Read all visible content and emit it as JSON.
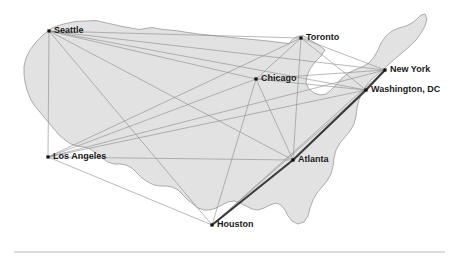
{
  "figure": {
    "title": "",
    "width": 457,
    "height": 265,
    "background_color": "#ffffff",
    "land_fill_color": "#e2e2e2",
    "land_stroke_color": "#9a9a9a",
    "edge_color": "#8a8a8a",
    "highlight_edge_color": "#3a3a3a",
    "label_color": "#1a1a1a",
    "divider_color": "#b9b9b9"
  },
  "chart_data": {
    "type": "scatter",
    "title": "",
    "xlabel": "",
    "ylabel": "",
    "subtitle": "",
    "legend": [],
    "grid": false,
    "nodes": [
      {
        "id": "seattle",
        "label": "Seattle",
        "x": 49,
        "y": 31,
        "label_dx": 5,
        "label_dy": 0,
        "anchor": "start"
      },
      {
        "id": "toronto",
        "label": "Toronto",
        "x": 301,
        "y": 38,
        "label_dx": 5,
        "label_dy": 0,
        "anchor": "start"
      },
      {
        "id": "chicago",
        "label": "Chicago",
        "x": 256,
        "y": 79,
        "label_dx": 5,
        "label_dy": 0,
        "anchor": "start"
      },
      {
        "id": "newyork",
        "label": "New York",
        "x": 385,
        "y": 70,
        "label_dx": 5,
        "label_dy": 0,
        "anchor": "start"
      },
      {
        "id": "washington",
        "label": "Washington, DC",
        "x": 366,
        "y": 90,
        "label_dx": 5,
        "label_dy": 0,
        "anchor": "start"
      },
      {
        "id": "losangeles",
        "label": "Los Angeles",
        "x": 48,
        "y": 157,
        "label_dx": 5,
        "label_dy": 0,
        "anchor": "start"
      },
      {
        "id": "atlanta",
        "label": "Atlanta",
        "x": 293,
        "y": 160,
        "label_dx": 5,
        "label_dy": 0,
        "anchor": "start"
      },
      {
        "id": "houston",
        "label": "Houston",
        "x": 212,
        "y": 225,
        "label_dx": 5,
        "label_dy": 0,
        "anchor": "start"
      }
    ],
    "edges": [
      {
        "from": "seattle",
        "to": "toronto",
        "weight": 1
      },
      {
        "from": "seattle",
        "to": "chicago",
        "weight": 1
      },
      {
        "from": "seattle",
        "to": "newyork",
        "weight": 1
      },
      {
        "from": "seattle",
        "to": "washington",
        "weight": 1
      },
      {
        "from": "seattle",
        "to": "atlanta",
        "weight": 1
      },
      {
        "from": "seattle",
        "to": "houston",
        "weight": 1
      },
      {
        "from": "seattle",
        "to": "losangeles",
        "weight": 1
      },
      {
        "from": "losangeles",
        "to": "chicago",
        "weight": 1
      },
      {
        "from": "losangeles",
        "to": "toronto",
        "weight": 1
      },
      {
        "from": "losangeles",
        "to": "newyork",
        "weight": 1
      },
      {
        "from": "losangeles",
        "to": "washington",
        "weight": 1
      },
      {
        "from": "losangeles",
        "to": "atlanta",
        "weight": 1
      },
      {
        "from": "losangeles",
        "to": "houston",
        "weight": 1
      },
      {
        "from": "chicago",
        "to": "toronto",
        "weight": 1
      },
      {
        "from": "chicago",
        "to": "newyork",
        "weight": 1
      },
      {
        "from": "chicago",
        "to": "washington",
        "weight": 1
      },
      {
        "from": "chicago",
        "to": "atlanta",
        "weight": 1
      },
      {
        "from": "chicago",
        "to": "houston",
        "weight": 1
      },
      {
        "from": "toronto",
        "to": "newyork",
        "weight": 1
      },
      {
        "from": "toronto",
        "to": "washington",
        "weight": 1
      },
      {
        "from": "toronto",
        "to": "atlanta",
        "weight": 1
      },
      {
        "from": "newyork",
        "to": "washington",
        "weight": 1
      },
      {
        "from": "newyork",
        "to": "atlanta",
        "weight": 1
      },
      {
        "from": "newyork",
        "to": "houston",
        "weight": 1
      },
      {
        "from": "washington",
        "to": "atlanta",
        "weight": 1
      },
      {
        "from": "washington",
        "to": "houston",
        "weight": 1
      },
      {
        "from": "atlanta",
        "to": "houston",
        "weight": 1
      }
    ],
    "highlighted_edges": [
      {
        "from": "houston",
        "to": "atlanta",
        "weight": 4
      },
      {
        "from": "atlanta",
        "to": "washington",
        "weight": 4
      },
      {
        "from": "washington",
        "to": "newyork",
        "weight": 4
      }
    ]
  },
  "map": {
    "land_path": "M 63,25 L 72,22 L 96,20 L 118,26 L 140,29 L 150,27 L 160,29 L 168,27 L 176,31 L 196,35 L 228,38 L 262,41 L 286,44 L 296,40 L 300,37 L 306,36 L 316,40 L 324,44 L 330,40 L 336,36 L 342,30 L 350,24 L 358,20 L 366,17 L 374,15 L 382,19 L 386,26 L 390,33 L 396,38 L 404,41 L 412,44 L 418,50 L 420,58 L 414,62 L 404,64 L 394,68 L 386,71 L 378,76 L 372,82 L 366,90 L 362,98 L 356,104 L 350,110 L 346,118 L 344,128 L 346,138 L 348,148 L 346,158 L 340,166 L 334,174 L 330,182 L 326,190 L 320,198 L 314,206 L 308,212 L 300,216 L 292,218 L 286,222 L 280,226 L 274,230 L 266,232 L 258,230 L 250,228 L 242,226 L 234,224 L 226,226 L 218,228 L 210,227 L 204,223 L 198,218 L 192,212 L 186,206 L 180,200 L 174,196 L 166,194 L 158,192 L 150,190 L 144,186 L 138,180 L 132,174 L 126,170 L 118,168 L 110,166 L 104,162 L 98,156 L 92,150 L 86,146 L 78,144 L 70,142 L 62,138 L 56,132 L 50,126 L 44,120 L 38,114 L 32,108 L 28,100 L 26,92 L 24,84 L 22,76 L 22,68 L 24,60 L 28,52 L 34,44 L 42,36 L 52,29 Z",
    "divider": {
      "x1": 14,
      "y1": 252,
      "x2": 445,
      "y2": 252
    }
  }
}
